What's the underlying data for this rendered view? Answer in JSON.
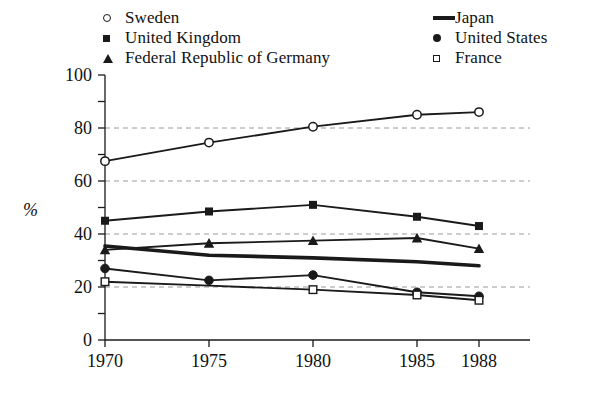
{
  "chart_data": {
    "type": "line",
    "title": "",
    "xlabel": "",
    "ylabel": "%",
    "x": [
      1970,
      1975,
      1980,
      1985,
      1988
    ],
    "xtick_labels": [
      "1970",
      "1975",
      "1980",
      "1985",
      "1988"
    ],
    "ytick_labels": [
      "0",
      "20",
      "40",
      "60",
      "80",
      "100"
    ],
    "yticks": [
      0,
      20,
      40,
      60,
      80,
      100
    ],
    "ylim": [
      0,
      100
    ],
    "minor_yticks": [
      10,
      30,
      50,
      70,
      90
    ],
    "grid": "horizontal-dashed at 20,40,60,80",
    "legend_position": "top, two columns, outside axes",
    "series": [
      {
        "name": "Sweden",
        "marker": "open-circle",
        "values": [
          67.5,
          74.5,
          80.5,
          85,
          86
        ]
      },
      {
        "name": "United Kingdom",
        "marker": "filled-square",
        "values": [
          45,
          48.5,
          51,
          46.5,
          43
        ]
      },
      {
        "name": "Federal Republic of Germany",
        "marker": "filled-triangle",
        "values": [
          34,
          36.5,
          37.5,
          38.5,
          34.5
        ]
      },
      {
        "name": "Japan",
        "marker": "thick-line",
        "values": [
          35.5,
          32,
          31,
          29.5,
          28
        ]
      },
      {
        "name": "United States",
        "marker": "filled-circle",
        "values": [
          27,
          22.5,
          24.5,
          18,
          16.5
        ]
      },
      {
        "name": "France",
        "marker": "open-square",
        "values": [
          22,
          20.5,
          19,
          17,
          15
        ]
      }
    ]
  },
  "legend": {
    "left_column": [
      {
        "label": "Sweden",
        "marker": "open-circle-icon"
      },
      {
        "label": "United Kingdom",
        "marker": "filled-square-icon"
      },
      {
        "label": "Federal Republic of Germany",
        "marker": "filled-triangle-icon"
      }
    ],
    "right_column": [
      {
        "label": "Japan",
        "marker": "thick-line-icon"
      },
      {
        "label": "United States",
        "marker": "filled-circle-icon"
      },
      {
        "label": "France",
        "marker": "open-square-icon"
      }
    ]
  },
  "axes": {
    "y_label": "%",
    "y_ticks": [
      "100",
      "80",
      "60",
      "40",
      "20",
      "0"
    ],
    "x_ticks": [
      "1970",
      "1975",
      "1980",
      "1985",
      "1988"
    ]
  },
  "colors": {
    "ink": "#1a1a1a",
    "grid": "#9a9a9a",
    "background": "#ffffff"
  }
}
